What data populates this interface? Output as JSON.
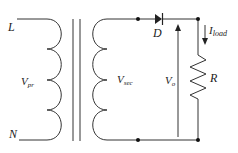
{
  "diagram": {
    "labels": {
      "line": "L",
      "neutral": "N",
      "v_primary_main": "V",
      "v_primary_sub": "pr",
      "v_secondary_main": "V",
      "v_secondary_sub": "sec",
      "diode": "D",
      "i_load_main": "I",
      "i_load_sub": "load",
      "v_out_main": "V",
      "v_out_sub": "o",
      "resistor": "R"
    },
    "colors": {
      "wire": "#333333",
      "text": "#222222",
      "background": "#ffffff"
    }
  }
}
